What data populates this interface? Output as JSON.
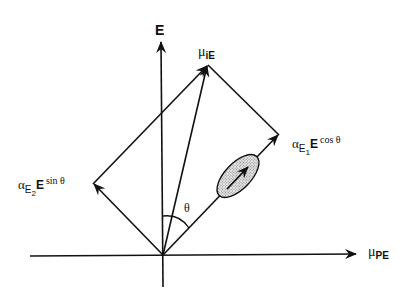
{
  "diagram": {
    "axes": {
      "vertical_label": "E",
      "horizontal_label_main": "μ",
      "horizontal_label_sub": "PE"
    },
    "vectors": {
      "resultant_label_main": "μ",
      "resultant_label_sub": "iE",
      "right_component": {
        "alpha": "α",
        "alpha_sub": "E",
        "alpha_sub_sub": "1",
        "field": "E",
        "trig": "cos θ"
      },
      "left_component": {
        "alpha": "α",
        "alpha_sub": "E",
        "alpha_sub_sub": "2",
        "field": "E",
        "trig": "sin θ"
      }
    },
    "angle_label": "θ",
    "colors": {
      "ink": "#111111",
      "ellipse_fill": "#c8c8c8",
      "background": "#ffffff"
    }
  }
}
